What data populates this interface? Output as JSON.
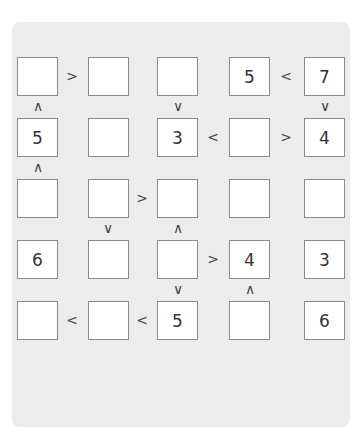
{
  "puzzle": {
    "type": "futoshiki",
    "size": 5,
    "colors": {
      "panel_bg": "#ececec",
      "cell_bg": "#ffffff",
      "cell_border": "#8a8a8a",
      "text": "#333333"
    },
    "grid": [
      [
        "",
        "",
        "",
        "5",
        "7"
      ],
      [
        "5",
        "",
        "3",
        "",
        "4"
      ],
      [
        "",
        "",
        "",
        "",
        ""
      ],
      [
        "6",
        "",
        "",
        "4",
        "3"
      ],
      [
        "",
        "",
        "5",
        "",
        "6"
      ]
    ],
    "horizontal_signs": [
      {
        "row": 0,
        "between_cols": [
          0,
          1
        ],
        "symbol": ">"
      },
      {
        "row": 0,
        "between_cols": [
          3,
          4
        ],
        "symbol": "<"
      },
      {
        "row": 1,
        "between_cols": [
          2,
          3
        ],
        "symbol": "<"
      },
      {
        "row": 1,
        "between_cols": [
          3,
          4
        ],
        "symbol": ">"
      },
      {
        "row": 2,
        "between_cols": [
          1,
          2
        ],
        "symbol": ">"
      },
      {
        "row": 3,
        "between_cols": [
          2,
          3
        ],
        "symbol": ">"
      },
      {
        "row": 4,
        "between_cols": [
          0,
          1
        ],
        "symbol": "<"
      },
      {
        "row": 4,
        "between_cols": [
          1,
          2
        ],
        "symbol": "<"
      }
    ],
    "vertical_signs": [
      {
        "col": 0,
        "between_rows": [
          0,
          1
        ],
        "symbol": "∧"
      },
      {
        "col": 2,
        "between_rows": [
          0,
          1
        ],
        "symbol": "∨"
      },
      {
        "col": 4,
        "between_rows": [
          0,
          1
        ],
        "symbol": "∨"
      },
      {
        "col": 0,
        "between_rows": [
          1,
          2
        ],
        "symbol": "∧"
      },
      {
        "col": 1,
        "between_rows": [
          2,
          3
        ],
        "symbol": "∨"
      },
      {
        "col": 2,
        "between_rows": [
          2,
          3
        ],
        "symbol": "∧"
      },
      {
        "col": 2,
        "between_rows": [
          3,
          4
        ],
        "symbol": "∨"
      },
      {
        "col": 3,
        "between_rows": [
          3,
          4
        ],
        "symbol": "∧"
      }
    ]
  }
}
